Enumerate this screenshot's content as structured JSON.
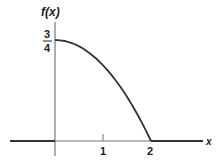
{
  "chart_data": {
    "type": "line",
    "title": "",
    "xlabel": "x",
    "ylabel": "f(x)",
    "x_ticks": [
      "1",
      "2"
    ],
    "y_ticks": [
      {
        "num": "3",
        "den": "4",
        "value": 0.75
      }
    ],
    "xlim": [
      -1.1,
      3.2
    ],
    "ylim": [
      0,
      0.85
    ],
    "grid": false,
    "legend": null,
    "series": [
      {
        "name": "f(x)",
        "x": [
          -1.1,
          0,
          0,
          0.25,
          0.5,
          0.75,
          1.0,
          1.25,
          1.5,
          1.75,
          2.0,
          2.0,
          3.2
        ],
        "y": [
          0,
          0,
          0.75,
          0.738,
          0.703,
          0.645,
          0.5625,
          0.457,
          0.328,
          0.176,
          0,
          0,
          0
        ]
      }
    ],
    "curve_formula_estimate": "f(x) = (3/16)(4 - x^2) for 0 <= x <= 2, else 0"
  },
  "labels": {
    "y_axis": "f(x)",
    "x_axis": "x",
    "tick_1": "1",
    "tick_2": "2",
    "y_tick_num": "3",
    "y_tick_den": "4"
  }
}
